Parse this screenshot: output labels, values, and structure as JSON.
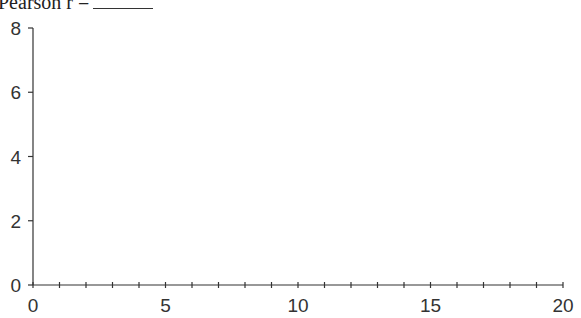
{
  "title": {
    "text": "Pearson r =",
    "blank": ""
  },
  "chart_data": {
    "type": "scatter",
    "xlabel": "",
    "ylabel": "",
    "xlim": [
      0,
      20
    ],
    "ylim": [
      0,
      8
    ],
    "x_ticks_major": [
      0,
      5,
      10,
      15,
      20
    ],
    "x_tick_labels": [
      "0",
      "5",
      "10",
      "15",
      "20"
    ],
    "x_ticks_minor_step": 1,
    "y_ticks": [
      0,
      2,
      4,
      6,
      8
    ],
    "y_tick_labels": [
      "0",
      "2",
      "4",
      "6",
      "8"
    ],
    "grid": false,
    "legend": null,
    "series": [
      {
        "name": "",
        "x": [],
        "y": []
      }
    ]
  },
  "colors": {
    "axis": "#333333",
    "text": "#333333"
  }
}
